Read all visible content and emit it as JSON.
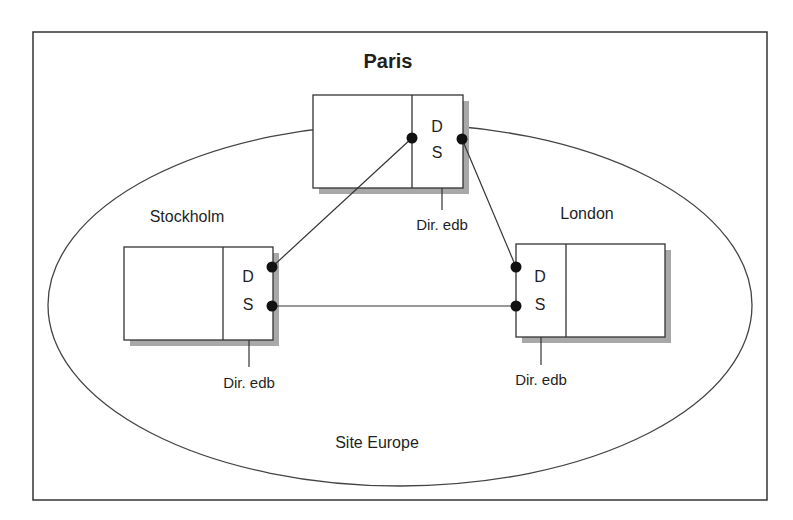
{
  "diagram": {
    "title": "Paris",
    "site_label": "Site Europe",
    "colors": {
      "stroke": "#333333",
      "shadow": "#a8a8a8",
      "dot": "#111111",
      "background": "#ffffff"
    },
    "nodes": [
      {
        "id": "paris",
        "name": "Paris",
        "ds_top": "D",
        "ds_bottom": "S",
        "db_label": "Dir. edb"
      },
      {
        "id": "stockholm",
        "name": "Stockholm",
        "ds_top": "D",
        "ds_bottom": "S",
        "db_label": "Dir. edb"
      },
      {
        "id": "london",
        "name": "London",
        "ds_top": "D",
        "ds_bottom": "S",
        "db_label": "Dir. edb"
      }
    ],
    "links": [
      {
        "from": "paris",
        "to": "stockholm"
      },
      {
        "from": "paris",
        "to": "london"
      },
      {
        "from": "stockholm",
        "to": "london"
      }
    ]
  }
}
